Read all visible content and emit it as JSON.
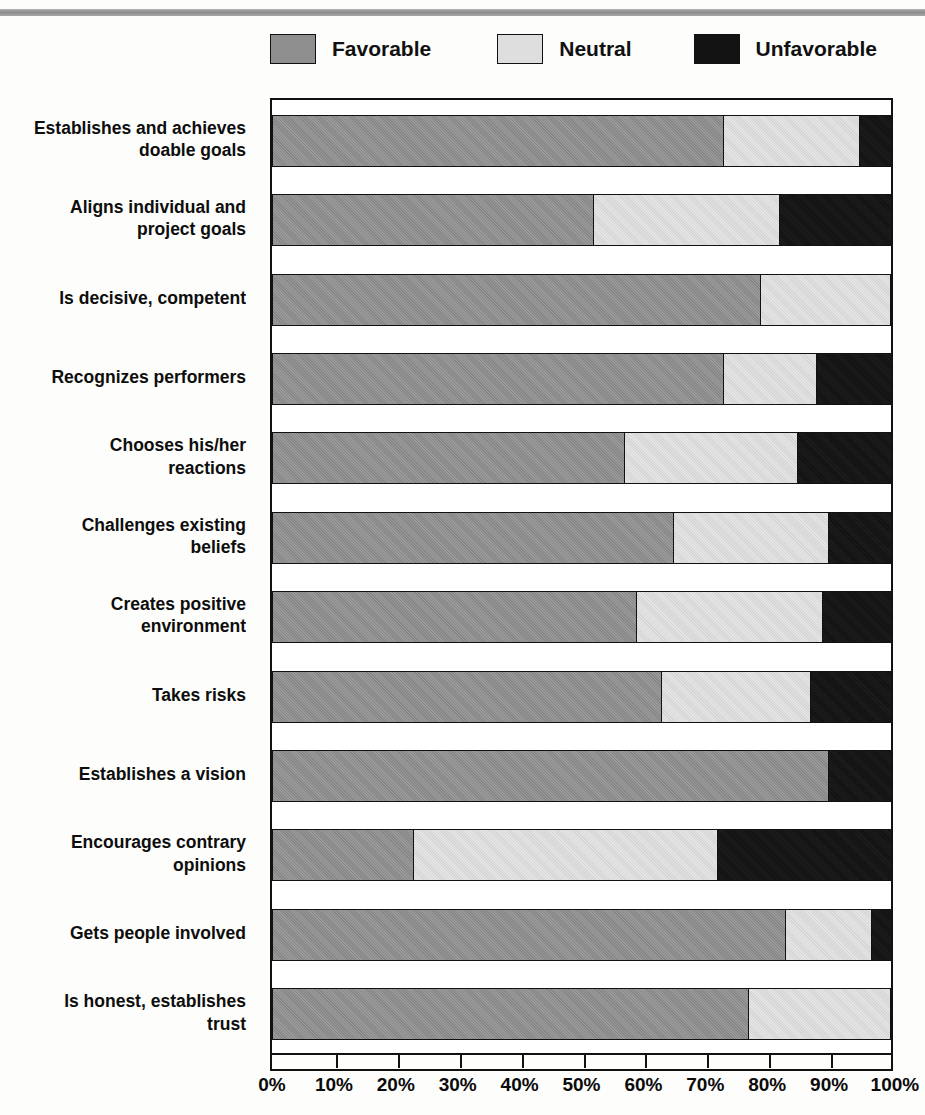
{
  "legend": {
    "items": [
      {
        "label": "Favorable",
        "key": "favorable",
        "color": "#8f8f8f"
      },
      {
        "label": "Neutral",
        "key": "neutral",
        "color": "#dedede"
      },
      {
        "label": "Unfavorable",
        "key": "unfavorable",
        "color": "#131313"
      }
    ]
  },
  "axis": {
    "ticks": [
      "0%",
      "10%",
      "20%",
      "30%",
      "40%",
      "50%",
      "60%",
      "70%",
      "80%",
      "90%",
      "100%"
    ]
  },
  "chart_data": {
    "type": "bar",
    "orientation": "horizontal",
    "stacked": true,
    "stack_total": 100,
    "title": "",
    "xlabel": "",
    "ylabel": "",
    "xlim": [
      0,
      100
    ],
    "grid": false,
    "legend_position": "top",
    "categories": [
      "Establishes and achieves doable goals",
      "Aligns individual and project goals",
      "Is decisive, competent",
      "Recognizes performers",
      "Chooses his/her reactions",
      "Challenges existing beliefs",
      "Creates positive environment",
      "Takes risks",
      "Establishes a vision",
      "Encourages contrary opinions",
      "Gets people involved",
      "Is honest, establishes trust"
    ],
    "category_lines": [
      [
        "Establishes and achieves",
        "doable goals"
      ],
      [
        "Aligns individual and",
        "project goals"
      ],
      [
        "Is decisive, competent"
      ],
      [
        "Recognizes performers"
      ],
      [
        "Chooses his/her",
        "reactions"
      ],
      [
        "Challenges existing",
        "beliefs"
      ],
      [
        "Creates positive",
        "environment"
      ],
      [
        "Takes risks"
      ],
      [
        "Establishes a vision"
      ],
      [
        "Encourages contrary",
        "opinions"
      ],
      [
        "Gets people involved"
      ],
      [
        "Is honest, establishes",
        "trust"
      ]
    ],
    "series": [
      {
        "name": "Favorable",
        "values": [
          73,
          52,
          79,
          73,
          57,
          65,
          59,
          63,
          90,
          23,
          83,
          77
        ]
      },
      {
        "name": "Neutral",
        "values": [
          22,
          30,
          21,
          15,
          28,
          25,
          30,
          24,
          0,
          49,
          14,
          23
        ]
      },
      {
        "name": "Unfavorable",
        "values": [
          5,
          18,
          0,
          12,
          15,
          10,
          11,
          13,
          10,
          28,
          3,
          0
        ]
      }
    ]
  }
}
